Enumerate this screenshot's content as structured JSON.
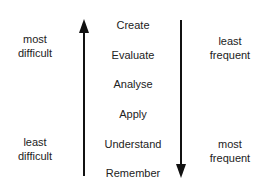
{
  "left_axis": {
    "top_label": [
      "most",
      "difficult"
    ],
    "bottom_label": [
      "least",
      "difficult"
    ],
    "arrow_direction": "up"
  },
  "levels": [
    "Create",
    "Evaluate",
    "Analyse",
    "Apply",
    "Understand",
    "Remember"
  ],
  "right_axis": {
    "top_label": [
      "least",
      "frequent"
    ],
    "bottom_label": [
      "most",
      "frequent"
    ],
    "arrow_direction": "down"
  }
}
